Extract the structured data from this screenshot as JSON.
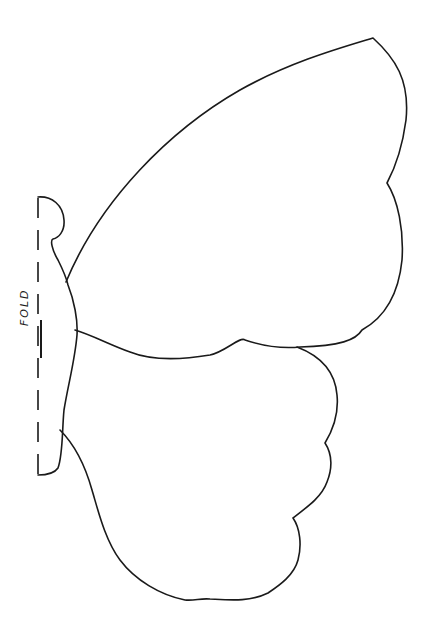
{
  "template": {
    "subject": "butterfly-wing-template",
    "fold_label": "FOLD",
    "stroke_color": "#1a1a1a",
    "background_color": "#ffffff"
  }
}
